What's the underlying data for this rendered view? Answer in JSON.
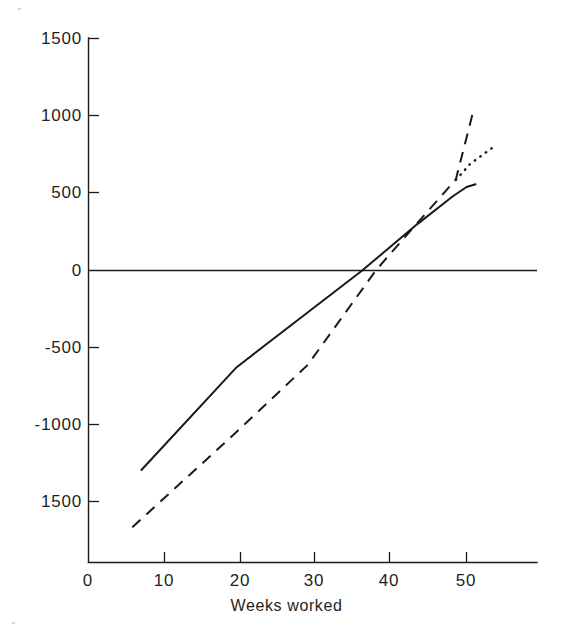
{
  "chart_data": {
    "type": "line",
    "title": "",
    "subtitle": "",
    "xlabel": "Weeks worked",
    "ylabel": "",
    "xlim": [
      0,
      59
    ],
    "ylim": [
      -1900,
      1500
    ],
    "grid": false,
    "legend": "none",
    "x_ticks": [
      {
        "value": 0,
        "label": "0"
      },
      {
        "value": 10,
        "label": "10"
      },
      {
        "value": 20,
        "label": "20"
      },
      {
        "value": 30,
        "label": "30"
      },
      {
        "value": 40,
        "label": "40"
      },
      {
        "value": 50,
        "label": "50"
      }
    ],
    "y_ticks": [
      {
        "value": 1500,
        "label": "1500"
      },
      {
        "value": 1000,
        "label": "1000"
      },
      {
        "value": 500,
        "label": "500"
      },
      {
        "value": 0,
        "label": "0"
      },
      {
        "value": -500,
        "label": "-500"
      },
      {
        "value": -1000,
        "label": "-1000"
      },
      {
        "value": -1500,
        "label": "1500"
      }
    ],
    "series": [
      {
        "name": "solid-series",
        "style": "solid",
        "color": "#1a1a1a",
        "points": [
          [
            7.0,
            -1290
          ],
          [
            19.6,
            -625
          ],
          [
            36.2,
            0
          ],
          [
            43.5,
            300
          ],
          [
            48.2,
            480
          ],
          [
            50.0,
            540
          ],
          [
            51.2,
            558
          ]
        ]
      },
      {
        "name": "dashed-series",
        "style": "dashed",
        "color": "#1a1a1a",
        "points": [
          [
            5.8,
            -1660
          ],
          [
            19.0,
            -1070
          ],
          [
            29.0,
            -610
          ],
          [
            38.0,
            0
          ],
          [
            43.0,
            280
          ],
          [
            47.0,
            500
          ],
          [
            48.6,
            590
          ],
          [
            51.0,
            1050
          ]
        ]
      },
      {
        "name": "dotted-series",
        "style": "dotted",
        "color": "#1a1a1a",
        "points": [
          [
            48.6,
            585
          ],
          [
            50.5,
            690
          ],
          [
            53.6,
            800
          ]
        ]
      }
    ]
  },
  "axes": {
    "x_axis_label": "Weeks worked",
    "zero_line_value": "0"
  }
}
